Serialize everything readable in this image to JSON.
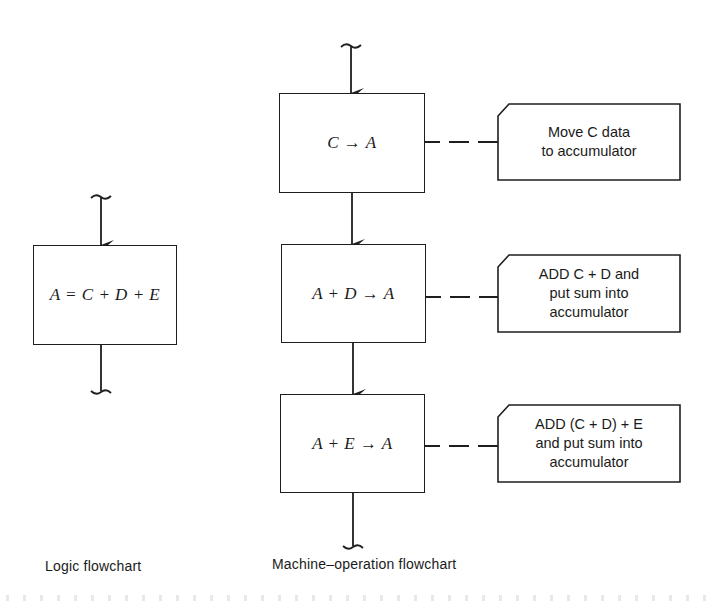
{
  "logic_flowchart": {
    "box": {
      "label": "A = C + D + E"
    },
    "caption": "Logic flowchart"
  },
  "machine_flowchart": {
    "steps": [
      {
        "label": "C → A",
        "note": "Move C data\nto accumulator"
      },
      {
        "label": "A + D → A",
        "note": "ADD C + D and\nput sum into\naccumulator"
      },
      {
        "label": "A + E → A",
        "note": "ADD (C + D) + E\nand put sum into\naccumulator"
      }
    ],
    "caption": "Machine–operation flowchart"
  },
  "colors": {
    "line": "#1e1e1e",
    "background": "#ffffff"
  }
}
